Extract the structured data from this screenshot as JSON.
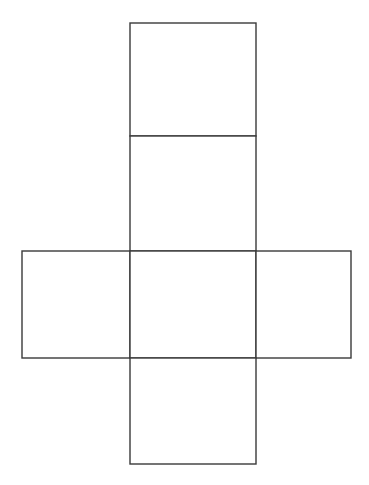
{
  "diagram": {
    "type": "cube-net",
    "stroke_color": "#3a3a3a",
    "background": "#ffffff",
    "faces": [
      {
        "name": "top",
        "x": 130,
        "y": 23,
        "w": 126,
        "h": 113
      },
      {
        "name": "upper-middle",
        "x": 130,
        "y": 136,
        "w": 126,
        "h": 115
      },
      {
        "name": "left",
        "x": 22,
        "y": 251,
        "w": 108,
        "h": 107
      },
      {
        "name": "center",
        "x": 130,
        "y": 251,
        "w": 126,
        "h": 107
      },
      {
        "name": "right",
        "x": 256,
        "y": 251,
        "w": 95,
        "h": 107
      },
      {
        "name": "bottom",
        "x": 130,
        "y": 358,
        "w": 126,
        "h": 106
      }
    ]
  }
}
